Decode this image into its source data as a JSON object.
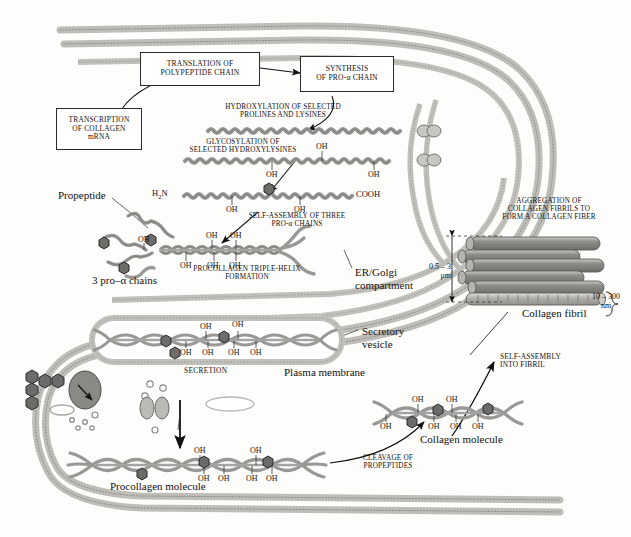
{
  "figure": {
    "domain": "biology-diagram"
  },
  "boxes": [
    {
      "id": "transcription",
      "lines": "TRANSCRIPTION\nOF COLLAGEN\nmRNA"
    },
    {
      "id": "translation",
      "lines": "TRANSLATION OF\nPOLYPEPTIDE CHAIN"
    },
    {
      "id": "synthesis",
      "lines": "SYNTHESIS\nOF PRO-α CHAIN"
    }
  ],
  "steps": {
    "hydroxylation": "HYDROXYLATION OF SELECTED\nPROLINES AND LYSINES",
    "glycosylation": "GLYCOSYLATION OF\nSELECTED HYDROXYLYSINES",
    "self_assembly_three": "SELF-ASSEMBLY OF THREE\nPRO-α CHAINS",
    "triple_helix": "PROCOLLAGEN TRIPLE-HELIX\nFORMATION",
    "secretion": "SECRETION",
    "cleavage": "CLEAVAGE OF\nPROPEPTIDES",
    "self_assembly_fibril": "SELF-ASSEMBLY\nINTO FIBRIL",
    "aggregation": "AGGREGATION OF\nCOLLAGEN FIBRILS TO\nFORM A COLLAGEN FIBER"
  },
  "labels": {
    "propeptide": "Propeptide",
    "three_pro_alpha_chains": "3 pro–α chains",
    "er_golgi": "ER/Golgi\ncompartment",
    "secretory_vesicle": "Secretory\nvesicle",
    "plasma_membrane": "Plasma membrane",
    "procollagen_molecule": "Procollagen molecule",
    "collagen_molecule": "Collagen molecule",
    "collagen_fibril": "Collagen fibril"
  },
  "chemistry": {
    "amino_terminus": "H2N",
    "carboxy_terminus": "COOH",
    "hydroxyl": "OH"
  },
  "dimensions": {
    "fiber_diameter": "0.5 – 3\nμm",
    "fiber_diameter_value": "0.5 – 3",
    "fiber_diameter_unit": "μm",
    "fibril_diameter": "10 – 300\nnm",
    "fibril_diameter_value": "10 – 300",
    "fibril_diameter_unit": "nm"
  },
  "ohmarks": {
    "chain2_top": [
      "OH"
    ],
    "chain2_bottom": [
      "OH",
      "OH"
    ],
    "chain3_bottom": [
      "OH",
      "OH"
    ],
    "helix_top": [
      "OH",
      "OH"
    ],
    "helix_bottom": [
      "OH",
      "OH",
      "OH"
    ],
    "helix_left": [
      "OH"
    ],
    "vesicle_top": [
      "OH",
      "OH"
    ],
    "vesicle_bottom": [
      "OH",
      "OH",
      "OH",
      "OH"
    ],
    "procollagen_top": [
      "OH",
      "OH"
    ],
    "procollagen_bottom": [
      "OH",
      "OH",
      "OH",
      "OH"
    ],
    "collagen_top": [
      "OH",
      "OH"
    ],
    "collagen_bottom": [
      "OH",
      "OH",
      "OH",
      "OH"
    ]
  },
  "colors": {
    "membrane": "#b9b6b0",
    "membrane_light": "#d9d7d2",
    "chain": "#8e8c87",
    "sugar": "#6d6d6d",
    "fibril": "#9b9995",
    "ink": "#1a1a1a",
    "background": "#fdfdfc"
  }
}
